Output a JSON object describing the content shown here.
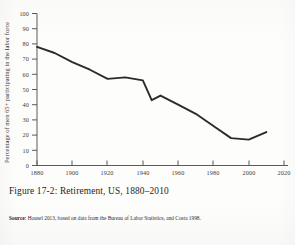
{
  "figure": {
    "caption": "Figure 17-2: Retirement, US, 1880–2010",
    "source_label": "Source:",
    "source_text": "Housel 2013, based on data from the Bureau of Labor Statistics, and Costa 1998."
  },
  "chart_data": {
    "type": "line",
    "title": "",
    "xlabel": "",
    "ylabel": "Percentage of men 65+ participating in the labor force",
    "xlim": [
      1880,
      2020
    ],
    "ylim": [
      0,
      100
    ],
    "grid": false,
    "legend": null,
    "xticks": [
      1880,
      1900,
      1920,
      1940,
      1960,
      1980,
      2000,
      2020
    ],
    "xtick_labels": [
      "1880",
      "1900",
      "1920",
      "1940",
      "1960",
      "1980",
      "2000",
      "2020"
    ],
    "yticks": [
      0,
      10,
      20,
      30,
      40,
      50,
      60,
      70,
      80,
      90,
      100
    ],
    "ytick_labels": [
      "0",
      "10",
      "20",
      "30",
      "40",
      "50",
      "60",
      "70",
      "80",
      "90",
      "100"
    ],
    "series": [
      {
        "name": "Men 65+ labor force participation",
        "color": "#2b2b2b",
        "x": [
          1880,
          1890,
          1900,
          1910,
          1920,
          1930,
          1940,
          1945,
          1950,
          1960,
          1970,
          1980,
          1990,
          2000,
          2010
        ],
        "values": [
          78,
          74,
          68,
          63,
          57,
          58,
          56,
          43,
          46,
          40,
          34,
          26,
          18,
          17,
          22
        ]
      }
    ]
  }
}
